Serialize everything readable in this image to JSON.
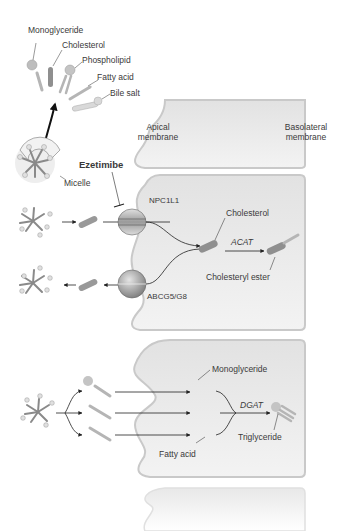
{
  "diagram": {
    "components_legend": {
      "monoglyceride": "Monoglyceride",
      "cholesterol": "Cholesterol",
      "phospholipid": "Phospholipid",
      "fatty_acid": "Fatty acid",
      "bile_salt": "Bile salt",
      "micelle": "Micelle"
    },
    "membranes": {
      "apical": "Apical\nmembrane",
      "apical_line1": "Apical",
      "apical_line2": "membrane",
      "basolateral_line1": "Basolateral",
      "basolateral_line2": "membrane"
    },
    "cholesterol_pathway": {
      "drug": "Ezetimibe",
      "importer": "NPC1L1",
      "exporter": "ABCG5/G8",
      "intracellular_cholesterol": "Cholesterol",
      "enzyme": "ACAT",
      "product": "Cholesteryl ester"
    },
    "triglyceride_pathway": {
      "monoglyceride": "Monoglyceride",
      "fatty_acid": "Fatty acid",
      "enzyme": "DGAT",
      "product": "Triglyceride"
    },
    "colors": {
      "cell_fill": "#ececec",
      "cell_border": "#c9c9c9",
      "molecule": "#a8a8a8",
      "cholesterol_rod": "#8f8f8f",
      "arrow": "#222222",
      "text": "#3a3a3a"
    }
  }
}
